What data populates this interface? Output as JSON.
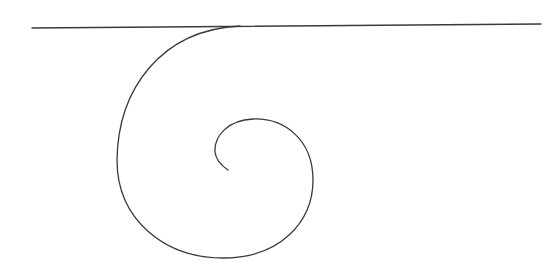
{
  "diagram": {
    "background": "#ffffff",
    "stroke_color": "#3a3a3a",
    "stroke_width": 1.3,
    "elements": [
      {
        "type": "line",
        "name": "tangent-line",
        "x1": 32,
        "y1": 28,
        "x2": 541,
        "y2": 24
      },
      {
        "type": "spiral",
        "name": "spiral-curve",
        "d": "M 240 26 C 160 30, 118 90, 117 160 C 117 220, 165 258, 223 258 C 280 258, 313 222, 313 180 C 313 140, 285 118, 253 119 C 228 120, 214 136, 215 152 C 216 160, 222 166, 228 170"
      }
    ]
  }
}
